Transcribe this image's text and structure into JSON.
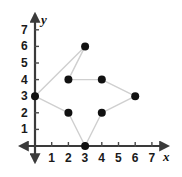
{
  "figure": {
    "width": 182,
    "height": 177,
    "background_color": "#ffffff"
  },
  "chart_data": {
    "type": "scatter",
    "title": "",
    "xlabel": "x",
    "ylabel": "y",
    "xlim": [
      -0.6,
      8.0
    ],
    "ylim": [
      -1.1,
      8.0
    ],
    "grid": false,
    "legend": null,
    "x_ticks": [
      1,
      2,
      3,
      4,
      5,
      6,
      7
    ],
    "y_ticks": [
      1,
      2,
      3,
      4,
      5,
      6,
      7
    ],
    "x_tick_labels": [
      "1",
      "2",
      "3",
      "4",
      "5",
      "6",
      "7"
    ],
    "y_tick_labels": [
      "1",
      "2",
      "3",
      "4",
      "5",
      "6",
      "7"
    ],
    "points": [
      {
        "label": "top-vertex",
        "x": 3,
        "y": 6
      },
      {
        "label": "upper-left",
        "x": 2,
        "y": 4
      },
      {
        "label": "upper-right",
        "x": 4,
        "y": 4
      },
      {
        "label": "right-vertex",
        "x": 6,
        "y": 3
      },
      {
        "label": "lower-right",
        "x": 4,
        "y": 2
      },
      {
        "label": "bottom-vertex",
        "x": 3,
        "y": 0
      },
      {
        "label": "lower-left",
        "x": 2,
        "y": 2
      },
      {
        "label": "left-vertex",
        "x": 0,
        "y": 3
      }
    ],
    "polygon_closed": true,
    "point_color": "#111111",
    "point_radius": 4,
    "edge_color": "#cfcfcf",
    "edge_width": 1.4,
    "axis_color": "#3a3a3a",
    "axis_width": 2.2,
    "tick_color": "#4a4a4a"
  },
  "axes": {
    "x_axis_label": "x",
    "y_axis_label": "y"
  }
}
